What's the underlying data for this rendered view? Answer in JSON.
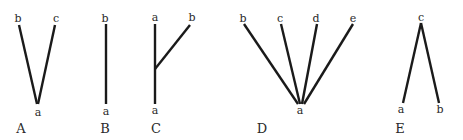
{
  "figure": {
    "panels": [
      {
        "id": "A",
        "label": "A",
        "nodes": {
          "top_left": "b",
          "top_right": "c",
          "bottom": "a"
        },
        "edges": [
          [
            "a",
            "b"
          ],
          [
            "a",
            "c"
          ]
        ]
      },
      {
        "id": "B",
        "label": "B",
        "nodes": {
          "top": "b",
          "bottom": "a"
        },
        "edges": [
          [
            "a",
            "b"
          ]
        ]
      },
      {
        "id": "C",
        "label": "C",
        "nodes": {
          "top_left": "a",
          "top_right": "b",
          "bottom": "a"
        },
        "edges": [
          [
            "a",
            "a"
          ],
          [
            "a",
            "b"
          ]
        ]
      },
      {
        "id": "D",
        "label": "D",
        "nodes": {
          "top_1": "b",
          "top_2": "c",
          "top_3": "d",
          "top_4": "e",
          "bottom": "a"
        },
        "edges": [
          [
            "a",
            "b"
          ],
          [
            "a",
            "c"
          ],
          [
            "a",
            "d"
          ],
          [
            "a",
            "e"
          ]
        ]
      },
      {
        "id": "E",
        "label": "E",
        "nodes": {
          "top": "c",
          "bottom_left": "a",
          "bottom_right": "b"
        },
        "edges": [
          [
            "c",
            "a"
          ],
          [
            "c",
            "b"
          ]
        ]
      }
    ],
    "colors": {
      "line": "#1a1a1a",
      "text": "#2a2a2a",
      "background": "#ffffff"
    }
  }
}
